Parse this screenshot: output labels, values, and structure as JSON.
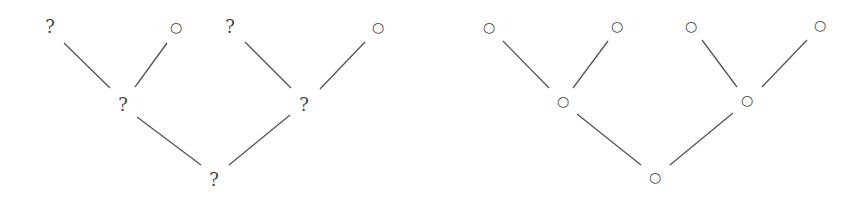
{
  "diagram": {
    "type": "binary-trees",
    "trees": [
      {
        "name": "left-tree",
        "nodes": [
          {
            "id": "L-leaf-1",
            "label": "?",
            "x": 50,
            "y": 27
          },
          {
            "id": "L-leaf-2",
            "label": "○",
            "x": 176,
            "y": 27
          },
          {
            "id": "L-leaf-3",
            "label": "?",
            "x": 230,
            "y": 27
          },
          {
            "id": "L-leaf-4",
            "label": "○",
            "x": 378,
            "y": 27
          },
          {
            "id": "L-mid-1",
            "label": "?",
            "x": 123,
            "y": 105
          },
          {
            "id": "L-mid-2",
            "label": "?",
            "x": 304,
            "y": 105
          },
          {
            "id": "L-root",
            "label": "?",
            "x": 214,
            "y": 180
          }
        ],
        "edges": [
          {
            "x1": 64,
            "y1": 43,
            "x2": 110,
            "y2": 88
          },
          {
            "x1": 167,
            "y1": 43,
            "x2": 135,
            "y2": 87
          },
          {
            "x1": 245,
            "y1": 42,
            "x2": 291,
            "y2": 88
          },
          {
            "x1": 365,
            "y1": 42,
            "x2": 320,
            "y2": 89
          },
          {
            "x1": 137,
            "y1": 117,
            "x2": 201,
            "y2": 165
          },
          {
            "x1": 290,
            "y1": 115,
            "x2": 229,
            "y2": 165
          }
        ]
      },
      {
        "name": "right-tree",
        "nodes": [
          {
            "id": "R-leaf-1",
            "label": "○",
            "x": 489,
            "y": 27
          },
          {
            "id": "R-leaf-2",
            "label": "○",
            "x": 617,
            "y": 26
          },
          {
            "id": "R-leaf-3",
            "label": "○",
            "x": 691,
            "y": 26
          },
          {
            "id": "R-leaf-4",
            "label": "○",
            "x": 820,
            "y": 25
          },
          {
            "id": "R-mid-1",
            "label": "○",
            "x": 563,
            "y": 101
          },
          {
            "id": "R-mid-2",
            "label": "○",
            "x": 747,
            "y": 100
          },
          {
            "id": "R-root",
            "label": "○",
            "x": 655,
            "y": 177
          }
        ],
        "edges": [
          {
            "x1": 503,
            "y1": 41,
            "x2": 549,
            "y2": 88
          },
          {
            "x1": 608,
            "y1": 41,
            "x2": 573,
            "y2": 88
          },
          {
            "x1": 702,
            "y1": 40,
            "x2": 737,
            "y2": 87
          },
          {
            "x1": 807,
            "y1": 40,
            "x2": 762,
            "y2": 87
          },
          {
            "x1": 577,
            "y1": 114,
            "x2": 641,
            "y2": 165
          },
          {
            "x1": 733,
            "y1": 113,
            "x2": 670,
            "y2": 165
          }
        ]
      }
    ]
  }
}
